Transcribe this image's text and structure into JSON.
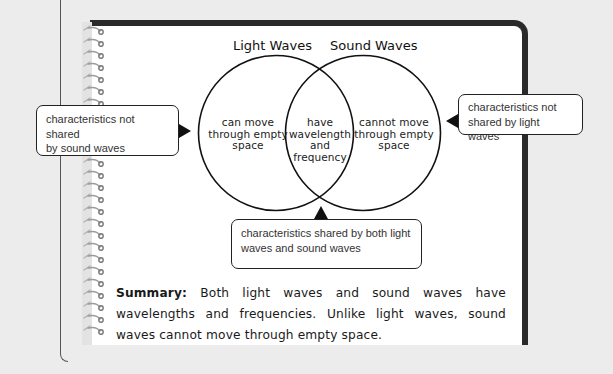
{
  "diagram": {
    "type": "venn",
    "sets": [
      {
        "title": "Light Waves",
        "unique_text_lines": [
          "can move",
          "through empty",
          "space"
        ]
      },
      {
        "title": "Sound Waves",
        "unique_text_lines": [
          "cannot move",
          "through empty",
          "space"
        ]
      }
    ],
    "intersection_text_lines": [
      "have",
      "wavelength",
      "and",
      "frequency"
    ]
  },
  "callouts": {
    "left": {
      "lines": [
        "characteristics not shared",
        "by sound waves"
      ]
    },
    "right": {
      "lines": [
        "characteristics not",
        "shared by light waves"
      ]
    },
    "bottom": {
      "lines": [
        "characteristics shared by both light",
        "waves and sound waves"
      ]
    }
  },
  "summary": {
    "label": "Summary:",
    "text": " Both light waves and sound waves have wavelengths and frequencies. Unlike light waves, sound waves cannot move through empty space."
  },
  "colors": {
    "page": "#ffffff",
    "background": "#ececec",
    "border": "#2a2a2a",
    "text": "#1a1a1a"
  }
}
